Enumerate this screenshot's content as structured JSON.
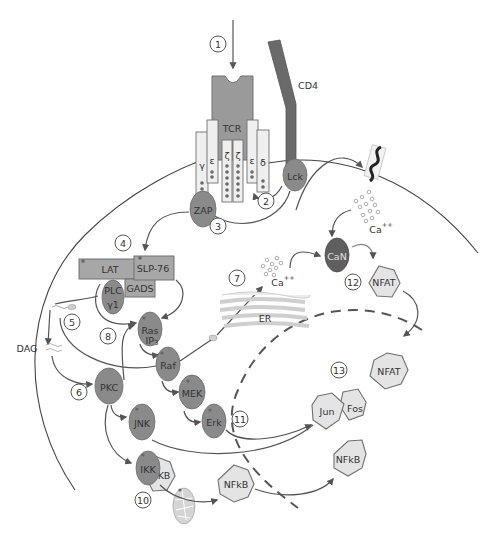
{
  "diagram": {
    "colors": {
      "molecule_fill": "#8a8a8a",
      "calcineurin_fill": "#5f5f5f",
      "transcription_factor_fill": "#e4e4e4",
      "receptor_fill": "#9a9a9a",
      "cd4_fill": "#6a6a6a",
      "line": "#555555"
    },
    "receptor": {
      "label": "TCR",
      "chains": {
        "gamma": "γ",
        "epsilon_left": "ε",
        "zeta_left": "ζ",
        "zeta_right": "ζ",
        "epsilon_right": "ε",
        "delta": "δ"
      },
      "coreceptor": "CD4"
    },
    "molecules": {
      "lck": "Lck",
      "zap": "ZAP",
      "lat": "LAT",
      "slp76": "SLP-76",
      "gads": "GADS",
      "plc_line1": "PLC",
      "plc_line2": "γ1",
      "ras": "Ras",
      "raf": "Raf",
      "mek": "MEK",
      "erk": "Erk",
      "pkc": "PKC",
      "jnk": "JNK",
      "ikk": "IKK",
      "ikb": "KB",
      "can": "CaN",
      "dag": "DAG",
      "ip3": "IP",
      "ip3_sub": "3",
      "er": "ER",
      "ca_er": "Ca",
      "ca_er_sup": "++",
      "ca_ext": "Ca",
      "ca_ext_sup": "++"
    },
    "transcription_factors": {
      "nfat_cyto": "NFAT",
      "nfat_nuc": "NFAT",
      "jun": "Jun",
      "fos": "Fos",
      "nfkb_cyto": "NFkB",
      "nfkb_nuc": "NFkB"
    },
    "steps": [
      "1",
      "2",
      "3",
      "4",
      "5",
      "6",
      "7",
      "8",
      "10",
      "11",
      "12",
      "13"
    ]
  }
}
